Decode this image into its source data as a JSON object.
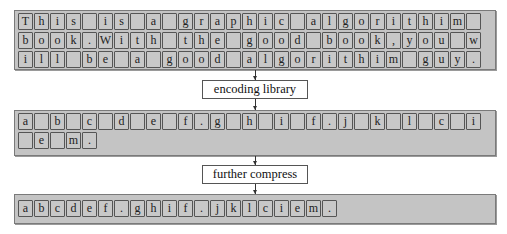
{
  "diagram": {
    "source_block": {
      "rows": [
        [
          "T",
          "h",
          "i",
          "s",
          "",
          "i",
          "s",
          "",
          "a",
          "",
          "g",
          "r",
          "a",
          "p",
          "h",
          "i",
          "c",
          "",
          "a",
          "l",
          "g",
          "o",
          "r",
          "i",
          "t",
          "h",
          "i",
          "m",
          ""
        ],
        [
          "b",
          "o",
          "o",
          "k",
          ".",
          "W",
          "i",
          "t",
          "h",
          "",
          "t",
          "h",
          "e",
          "",
          "g",
          "o",
          "o",
          "d",
          "",
          "b",
          "o",
          "o",
          "k",
          ",",
          "y",
          "o",
          "u",
          "",
          "w"
        ],
        [
          "i",
          "l",
          "l",
          "",
          "b",
          "e",
          "",
          "a",
          "",
          "g",
          "o",
          "o",
          "d",
          "",
          "a",
          "l",
          "g",
          "o",
          "r",
          "i",
          "t",
          "h",
          "i",
          "m",
          "",
          "g",
          "u",
          "y",
          "."
        ]
      ]
    },
    "step1_label": "encoding library",
    "encoded_block": {
      "rows": [
        [
          "a",
          "",
          "b",
          "",
          "c",
          "",
          "d",
          "",
          "e",
          "",
          "f",
          ".",
          "g",
          "",
          "h",
          "",
          "i",
          "",
          "f",
          ".",
          "j",
          "",
          "k",
          "",
          "l",
          "",
          "c",
          "",
          "i"
        ],
        [
          "",
          "e",
          "",
          "m",
          "."
        ]
      ]
    },
    "step2_label": "further compress",
    "compressed_block": {
      "rows": [
        [
          "a",
          "b",
          "c",
          "d",
          "e",
          "f",
          ".",
          "g",
          "h",
          "i",
          "f",
          ".",
          "j",
          "k",
          "l",
          "c",
          "i",
          "e",
          "m",
          "."
        ]
      ]
    },
    "colors": {
      "panel_fill": "#c4c4c4",
      "cell_border": "#555555",
      "label_fill": "#ffffff"
    }
  }
}
